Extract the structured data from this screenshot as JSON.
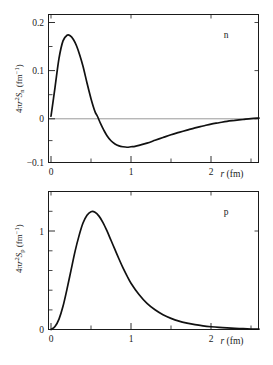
{
  "figure": {
    "panels": [
      {
        "id": "neutron",
        "badge": "n",
        "ylabel_prefix": "4π",
        "ylabel_var": "r",
        "ylabel_exp": "2",
        "ylabel_sym": "S",
        "ylabel_sub": "n",
        "ylabel_units": " (fm",
        "ylabel_units_exp": "−1",
        "ylabel_units_close": ")",
        "xlabel_var": "r",
        "xlabel_units": " (fm)",
        "ytick_labels": [
          "0.2",
          "0.1",
          "0",
          "−0.1"
        ],
        "xtick_labels": [
          "0",
          "1",
          "2"
        ]
      },
      {
        "id": "proton",
        "badge": "p",
        "ylabel_prefix": "4π",
        "ylabel_var": "r",
        "ylabel_exp": "2",
        "ylabel_sym": "S",
        "ylabel_sub": "p",
        "ylabel_units": " (fm",
        "ylabel_units_exp": "−1",
        "ylabel_units_close": ")",
        "xlabel_var": "r",
        "xlabel_units": " (fm)",
        "ytick_labels": [
          "1",
          "0"
        ],
        "xtick_labels": [
          "0",
          "1",
          "2"
        ]
      }
    ]
  },
  "chart_data": [
    {
      "type": "line",
      "id": "neutron-panel",
      "title": "",
      "annotation": "n",
      "xlabel": "r (fm)",
      "ylabel": "4πr²S_n (fm⁻¹)",
      "xlim": [
        0,
        2.6
      ],
      "ylim": [
        -0.1,
        0.22
      ],
      "xticks": [
        0,
        1,
        2
      ],
      "yticks": [
        -0.1,
        0,
        0.1,
        0.2
      ],
      "xminorticks": [
        0.5,
        1.5,
        2.5
      ],
      "yminorticks": [
        -0.05,
        0.05,
        0.15
      ],
      "grid": false,
      "legend": false,
      "zero_reference_line": true,
      "series": [
        {
          "name": "4πr²S_n",
          "x": [
            0.0,
            0.05,
            0.1,
            0.15,
            0.2,
            0.24,
            0.28,
            0.32,
            0.36,
            0.4,
            0.45,
            0.5,
            0.55,
            0.58,
            0.62,
            0.66,
            0.7,
            0.75,
            0.8,
            0.85,
            0.9,
            0.95,
            1.0,
            1.05,
            1.1,
            1.2,
            1.3,
            1.4,
            1.5,
            1.6,
            1.7,
            1.8,
            1.9,
            2.0,
            2.1,
            2.2,
            2.3,
            2.4,
            2.5,
            2.6
          ],
          "y": [
            0.0,
            0.062,
            0.125,
            0.163,
            0.175,
            0.174,
            0.166,
            0.152,
            0.132,
            0.108,
            0.072,
            0.038,
            0.01,
            0.0,
            -0.016,
            -0.03,
            -0.042,
            -0.053,
            -0.06,
            -0.064,
            -0.066,
            -0.067,
            -0.066,
            -0.065,
            -0.063,
            -0.058,
            -0.052,
            -0.046,
            -0.04,
            -0.035,
            -0.03,
            -0.025,
            -0.021,
            -0.017,
            -0.014,
            -0.011,
            -0.009,
            -0.007,
            -0.005,
            -0.004
          ]
        }
      ]
    },
    {
      "type": "line",
      "id": "proton-panel",
      "title": "",
      "annotation": "p",
      "xlabel": "r (fm)",
      "ylabel": "4πr²S_p (fm⁻¹)",
      "xlim": [
        0,
        2.6
      ],
      "ylim": [
        0,
        1.4
      ],
      "xticks": [
        0,
        1,
        2
      ],
      "yticks": [
        0,
        1
      ],
      "xminorticks": [
        0.5,
        1.5,
        2.5
      ],
      "yminorticks": [
        0.2,
        0.4,
        0.6,
        0.8,
        1.2
      ],
      "grid": false,
      "legend": false,
      "zero_reference_line": false,
      "series": [
        {
          "name": "4πr²S_p",
          "x": [
            0.0,
            0.05,
            0.1,
            0.15,
            0.2,
            0.25,
            0.3,
            0.35,
            0.4,
            0.45,
            0.5,
            0.55,
            0.6,
            0.65,
            0.7,
            0.75,
            0.8,
            0.85,
            0.9,
            0.95,
            1.0,
            1.1,
            1.2,
            1.3,
            1.4,
            1.5,
            1.6,
            1.7,
            1.8,
            1.9,
            2.0,
            2.1,
            2.2,
            2.3,
            2.4,
            2.5,
            2.6
          ],
          "y": [
            0.0,
            0.03,
            0.105,
            0.235,
            0.41,
            0.6,
            0.79,
            0.95,
            1.08,
            1.16,
            1.195,
            1.19,
            1.15,
            1.085,
            1.0,
            0.905,
            0.81,
            0.715,
            0.625,
            0.545,
            0.47,
            0.355,
            0.265,
            0.2,
            0.15,
            0.113,
            0.085,
            0.065,
            0.049,
            0.037,
            0.028,
            0.021,
            0.016,
            0.012,
            0.008,
            0.005,
            0.003
          ]
        }
      ]
    }
  ]
}
